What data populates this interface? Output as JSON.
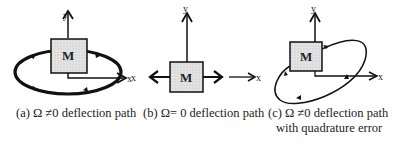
{
  "panels": [
    {
      "id": "a",
      "mass_label": "M",
      "x_label": "x",
      "y_label": "y",
      "caption": "(a) Ω ≠0 deflection path"
    },
    {
      "id": "b",
      "mass_label": "M",
      "x_label": "x",
      "x_label_left": "x",
      "y_label": "y",
      "caption": "(b) Ω= 0 deflection path"
    },
    {
      "id": "c",
      "mass_label": "M",
      "x_label": "x",
      "y_label": "y",
      "caption_line1": "(c) Ω ≠0 deflection path",
      "caption_line2": "with quadrature error"
    }
  ]
}
